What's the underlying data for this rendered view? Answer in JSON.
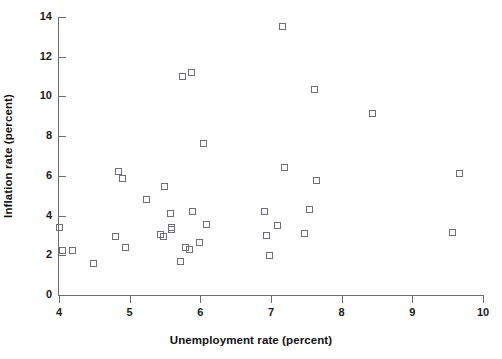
{
  "chart_data": {
    "type": "scatter",
    "title": "",
    "xlabel": "Unemployment rate (percent)",
    "ylabel": "Inflation rate (percent)",
    "xlim": [
      4,
      10
    ],
    "ylim": [
      0,
      14
    ],
    "xticks": [
      "4",
      "5",
      "6",
      "7",
      "8",
      "9",
      "10"
    ],
    "yticks": [
      "0",
      "2",
      "4",
      "6",
      "8",
      "10",
      "12",
      "14"
    ],
    "grid": false,
    "legend": null,
    "marker": "open-square",
    "marker_color": "#6e6e76",
    "points": [
      {
        "x": 4.02,
        "y": 3.35
      },
      {
        "x": 4.05,
        "y": 2.2
      },
      {
        "x": 4.2,
        "y": 2.2
      },
      {
        "x": 4.5,
        "y": 1.55
      },
      {
        "x": 4.85,
        "y": 6.2
      },
      {
        "x": 4.9,
        "y": 5.85
      },
      {
        "x": 4.8,
        "y": 2.9
      },
      {
        "x": 4.95,
        "y": 2.35
      },
      {
        "x": 5.25,
        "y": 4.8
      },
      {
        "x": 5.5,
        "y": 5.45
      },
      {
        "x": 5.45,
        "y": 3.0
      },
      {
        "x": 5.48,
        "y": 2.9
      },
      {
        "x": 5.6,
        "y": 3.35
      },
      {
        "x": 5.6,
        "y": 3.25
      },
      {
        "x": 5.58,
        "y": 4.1
      },
      {
        "x": 5.72,
        "y": 1.65
      },
      {
        "x": 5.75,
        "y": 11.0
      },
      {
        "x": 5.88,
        "y": 11.2
      },
      {
        "x": 5.8,
        "y": 2.35
      },
      {
        "x": 5.85,
        "y": 2.25
      },
      {
        "x": 5.9,
        "y": 4.2
      },
      {
        "x": 6.05,
        "y": 7.6
      },
      {
        "x": 6.0,
        "y": 2.6
      },
      {
        "x": 6.1,
        "y": 3.55
      },
      {
        "x": 6.92,
        "y": 4.2
      },
      {
        "x": 6.95,
        "y": 2.95
      },
      {
        "x": 6.98,
        "y": 1.95
      },
      {
        "x": 7.1,
        "y": 3.5
      },
      {
        "x": 7.17,
        "y": 13.5
      },
      {
        "x": 7.2,
        "y": 6.4
      },
      {
        "x": 7.48,
        "y": 3.05
      },
      {
        "x": 7.55,
        "y": 4.3
      },
      {
        "x": 7.62,
        "y": 10.3
      },
      {
        "x": 7.65,
        "y": 5.75
      },
      {
        "x": 8.45,
        "y": 9.1
      },
      {
        "x": 9.57,
        "y": 3.1
      },
      {
        "x": 9.68,
        "y": 6.1
      }
    ]
  },
  "axes": {
    "x_tick_values": [
      4,
      5,
      6,
      7,
      8,
      9,
      10
    ],
    "y_tick_values": [
      0,
      2,
      4,
      6,
      8,
      10,
      12,
      14
    ]
  }
}
